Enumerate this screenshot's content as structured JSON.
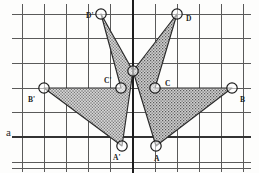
{
  "figure": {
    "width": 259,
    "height": 173,
    "background_color": "#fdfdfc"
  },
  "grid": {
    "vertical_lines_x": [
      22,
      44,
      66,
      88,
      110,
      133,
      155,
      177,
      199,
      221,
      243
    ],
    "horizontal_lines_y": [
      14,
      38,
      63,
      88,
      112,
      137,
      162
    ],
    "line_color": "#555555",
    "line_width": 1,
    "spacing_x": 22,
    "spacing_y": 24.6,
    "frame_top_y": 14,
    "frame_bottom_y": 168,
    "frame_left_x": 12,
    "frame_right_x": 251
  },
  "mirror_axis": {
    "name": "vertical-symmetry-axis",
    "x": 133,
    "y_start": 0,
    "y_end": 173,
    "color": "#1c1c1c",
    "line_width": 2.1
  },
  "line_a": {
    "label": "a",
    "y": 137,
    "x_start": 12,
    "x_end": 251,
    "color": "#3a3a3a"
  },
  "shape_style": {
    "stroke_color": "#2b2b2b",
    "stroke_width": 1.1,
    "fill_color": "#b9b9b9",
    "fill_pattern": "stipple-dots",
    "stipple_dot_color": "#4a4a4a",
    "marker_radius": 5.2,
    "marker_stroke": "#1c1c1c",
    "marker_fill": "#ffffff"
  },
  "vertices": [
    {
      "id": "D-prime",
      "label": "D'",
      "x": 101,
      "y": 14,
      "label_x": 86,
      "label_y": 12,
      "shape": "reflected"
    },
    {
      "id": "D",
      "label": "D",
      "x": 177,
      "y": 14,
      "label_x": 186,
      "label_y": 15,
      "shape": "original"
    },
    {
      "id": "apex",
      "label": "",
      "x": 133,
      "y": 71,
      "label_x": 133,
      "label_y": 71,
      "shape": "shared"
    },
    {
      "id": "C-prime",
      "label": "C'",
      "x": 121,
      "y": 88,
      "label_x": 104,
      "label_y": 77,
      "shape": "reflected"
    },
    {
      "id": "C",
      "label": "C",
      "x": 155,
      "y": 88,
      "label_x": 165,
      "label_y": 80,
      "shape": "original"
    },
    {
      "id": "B-prime",
      "label": "B'",
      "x": 44,
      "y": 88,
      "label_x": 28,
      "label_y": 96,
      "shape": "reflected"
    },
    {
      "id": "B",
      "label": "B",
      "x": 232,
      "y": 88,
      "label_x": 240,
      "label_y": 96,
      "shape": "original"
    },
    {
      "id": "A-prime",
      "label": "A'",
      "x": 122,
      "y": 146,
      "label_x": 113,
      "label_y": 154,
      "shape": "reflected"
    },
    {
      "id": "A",
      "label": "A",
      "x": 156,
      "y": 146,
      "label_x": 154,
      "label_y": 155,
      "shape": "original"
    }
  ],
  "polygons": [
    {
      "id": "polygon-original",
      "name": "original-arrow-shape",
      "vertex_ids": [
        "D",
        "apex",
        "A",
        "B",
        "C"
      ],
      "points": "177,14 133,71 156,146 232,88 155,88",
      "path": "M177,14 L133,71 L156,146 L232,88 L155,88 Z"
    },
    {
      "id": "polygon-reflected",
      "name": "reflected-arrow-shape",
      "vertex_ids": [
        "D-prime",
        "apex",
        "A-prime",
        "B-prime",
        "C-prime"
      ],
      "points": "101,14 133,71 122,146 44,88 121,88",
      "path": "M101,14 L133,71 L122,146 L44,88 L121,88 Z"
    }
  ],
  "sub_paths": {
    "original_upper": "M177,14 L133,71 L155,88 Z",
    "original_lower": "M155,88 L133,71 L156,146 L232,88 Z",
    "reflected_upper": "M101,14 L133,71 L121,88 Z",
    "reflected_lower": "M121,88 L133,71 L122,146 L44,88 Z"
  }
}
